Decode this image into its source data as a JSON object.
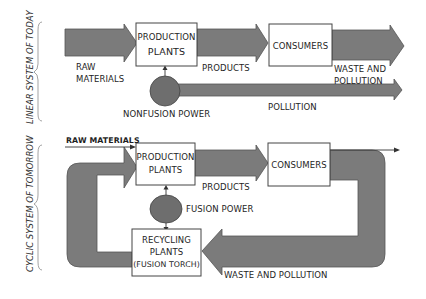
{
  "diagram": {
    "colors": {
      "arrow_fill": "#7b7b7b",
      "circle_fill": "#6e6e6e",
      "box_fill": "#ffffff",
      "stroke": "#444444"
    },
    "linear_system": {
      "side_label": "LINEAR SYSTEM OF TODAY",
      "nodes": {
        "production": {
          "line1": "PRODUCTION",
          "line2": "PLANTS"
        },
        "consumers": {
          "label": "CONSUMERS"
        },
        "power": {
          "label": "NONFUSION POWER"
        }
      },
      "flows": {
        "raw_materials": {
          "line1": "RAW",
          "line2": "MATERIALS"
        },
        "products": {
          "label": "PRODUCTS"
        },
        "waste": {
          "line1": "WASTE AND",
          "line2": "POLLUTION"
        },
        "pollution": {
          "label": "POLLUTION"
        }
      }
    },
    "cyclic_system": {
      "side_label": "CYCLIC SYSTEM OF TOMORROW",
      "nodes": {
        "production": {
          "line1": "PRODUCTION",
          "line2": "PLANTS"
        },
        "consumers": {
          "label": "CONSUMERS"
        },
        "power": {
          "label": "FUSION POWER"
        },
        "recycling": {
          "line1": "RECYCLING",
          "line2": "PLANTS",
          "line3": "(FUSION TORCH)"
        }
      },
      "flows": {
        "raw_materials": {
          "label": "RAW MATERIALS"
        },
        "products": {
          "label": "PRODUCTS"
        },
        "waste": {
          "label": "WASTE AND POLLUTION"
        }
      }
    }
  }
}
